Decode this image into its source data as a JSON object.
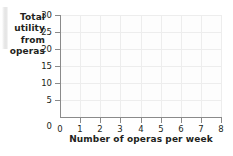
{
  "chart_data": {
    "type": "scatter",
    "title": "",
    "subtitle": "",
    "xlabel": "Number of operas per week",
    "ylabel": "Total utility from operas",
    "ylabel_lines": [
      "Total",
      "utility",
      "from",
      "operas"
    ],
    "x": [],
    "values": [],
    "series": [],
    "annotations": [],
    "legend": [],
    "legend_position": "none",
    "grid": true,
    "xlim": [
      0,
      8
    ],
    "ylim": [
      0,
      30
    ],
    "xtick_step": 1,
    "ytick_step": 5,
    "xticks": [
      "0",
      "1",
      "2",
      "3",
      "4",
      "5",
      "6",
      "7",
      "8"
    ],
    "yticks": [
      "0",
      "5",
      "10",
      "15",
      "20",
      "25",
      "30"
    ],
    "colors": {
      "background": "#ffffff",
      "plot_background": "#fdfdfd",
      "axis": "#8a8a8a",
      "gridline": "#ededed",
      "text": "#231f20"
    }
  }
}
